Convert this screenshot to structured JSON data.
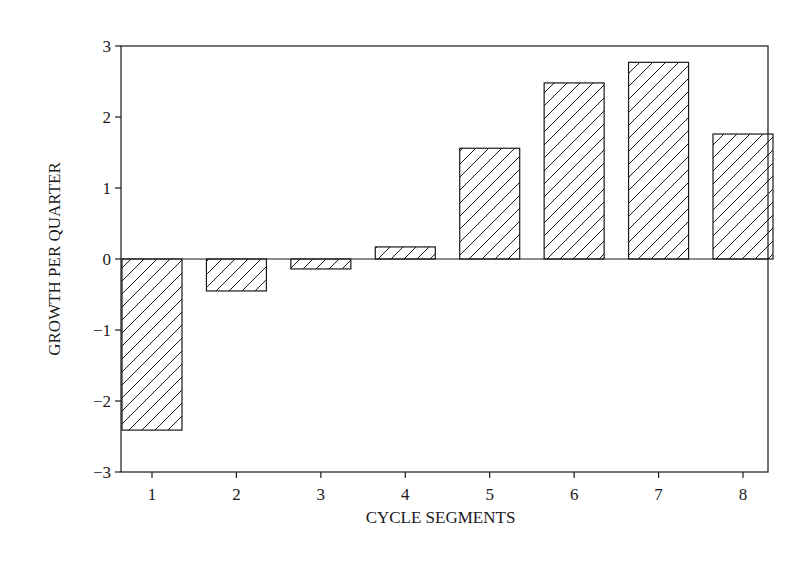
{
  "chart_data": {
    "type": "bar",
    "title": "",
    "xlabel": "CYCLE SEGMENTS",
    "ylabel": "GROWTH PER QUARTER",
    "categories": [
      "1",
      "2",
      "3",
      "4",
      "5",
      "6",
      "7",
      "8"
    ],
    "values": [
      -2.41,
      -0.45,
      -0.14,
      0.17,
      1.56,
      2.48,
      2.77,
      1.76
    ],
    "ylim": [
      -3,
      3
    ],
    "yticks": [
      -3,
      -2,
      -1,
      0,
      1,
      2,
      3
    ],
    "ytick_labels": [
      "−3",
      "−2",
      "−1",
      "0",
      "1",
      "2",
      "3"
    ],
    "grid": false,
    "legend": null,
    "bar_fill": "diagonal-hatch",
    "colors": {
      "stroke": "#1a1a1a",
      "background": "#ffffff"
    }
  }
}
